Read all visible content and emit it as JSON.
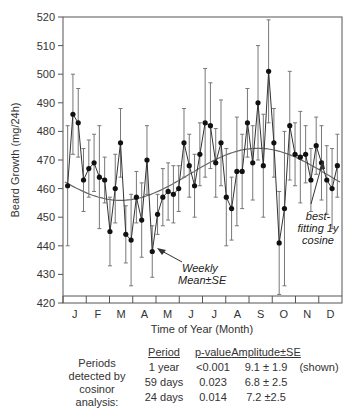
{
  "chart_data": {
    "type": "line",
    "title": "",
    "xlabel": "Time of Year (Month)",
    "ylabel": "Beard Growth (mg/24h)",
    "ylim": [
      420,
      520
    ],
    "yticks": [
      420,
      430,
      440,
      450,
      460,
      470,
      480,
      490,
      500,
      510,
      520
    ],
    "xticks": [
      "J",
      "F",
      "M",
      "A",
      "M",
      "J",
      "J",
      "A",
      "S",
      "O",
      "N",
      "D"
    ],
    "grid": false,
    "series": [
      {
        "name": "Weekly Mean±SE",
        "x_week": [
          1,
          2,
          3,
          4,
          5,
          6,
          7,
          8,
          9,
          10,
          11,
          12,
          13,
          14,
          15,
          16,
          17,
          18,
          19,
          20,
          21,
          22,
          23,
          24,
          25,
          26,
          27,
          28,
          29,
          30,
          31,
          32,
          33,
          34,
          35,
          36,
          37,
          38,
          39,
          40,
          41,
          42,
          43,
          44,
          45,
          46,
          47,
          48,
          49,
          50,
          51,
          52
        ],
        "values": [
          461,
          486,
          483,
          463,
          467,
          469,
          464,
          463,
          445,
          460,
          476,
          444,
          442,
          457,
          449,
          470,
          438,
          451,
          457,
          459,
          458,
          460,
          476,
          468,
          461,
          472,
          483,
          482,
          469,
          476,
          457,
          453,
          466,
          466,
          483,
          469,
          490,
          468,
          501,
          476,
          441,
          453,
          482,
          472,
          471,
          472,
          463,
          475,
          469,
          463,
          460,
          468
        ],
        "se": [
          21,
          14,
          12,
          11,
          10,
          10,
          18,
          8,
          12,
          12,
          12,
          10,
          16,
          9,
          13,
          12,
          9,
          7,
          10,
          10,
          10,
          8,
          12,
          11,
          11,
          11,
          19,
          15,
          12,
          15,
          17,
          11,
          19,
          13,
          12,
          13,
          20,
          18,
          18,
          12,
          18,
          27,
          19,
          11,
          16,
          10,
          11,
          10,
          13,
          12,
          14,
          11
        ]
      },
      {
        "name": "best-fitting 1y cosine",
        "mesor": 465,
        "amplitude": 9.1,
        "peak_month": "Sep",
        "description": "smooth cosine fit, ~468 in Jan, minimum ~456 around Apr-May, maximum ~474 around Sep"
      }
    ],
    "annotations": [
      "Weekly Mean±SE",
      "best-fitting 1y cosine"
    ],
    "cosinor_table": {
      "row_label": "Periods detected by cosinor analysis:",
      "columns": [
        "Period",
        "p-value",
        "Amplitude±SE"
      ],
      "rows": [
        [
          "1 year",
          "<0.001",
          "9.1 ± 1.9",
          "(shown)"
        ],
        [
          "59 days",
          "0.023",
          "6.8 ± 2.5",
          ""
        ],
        [
          "24 days",
          "0.014",
          "7.2 ±2.5",
          ""
        ]
      ]
    }
  },
  "labels": {
    "ylabel": "Beard Growth (mg/24h)",
    "xlabel": "Time of Year (Month)",
    "annot_weekly_1": "Weekly",
    "annot_weekly_2": "Mean±SE",
    "annot_fit_1": "best-",
    "annot_fit_2": "fitting 1y",
    "annot_fit_3": "cosine"
  },
  "table": {
    "row_label_lines": [
      "Periods",
      "detected by",
      "cosinor",
      "analysis:"
    ],
    "headers": {
      "period": "Period",
      "pvalue": "p-value",
      "amplitude": "Amplitude±SE"
    },
    "rows": [
      {
        "period": "1 year",
        "pvalue": "<0.001",
        "amplitude": "9.1 ± 1.9",
        "note": "(shown)"
      },
      {
        "period": "59 days",
        "pvalue": "0.023",
        "amplitude": "6.8 ± 2.5",
        "note": ""
      },
      {
        "period": "24 days",
        "pvalue": "0.014",
        "amplitude": "7.2 ±2.5",
        "note": ""
      }
    ]
  }
}
